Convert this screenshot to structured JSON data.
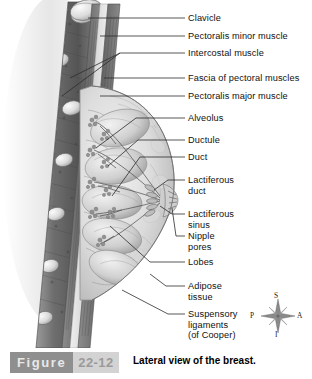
{
  "figure": {
    "label": "Figure",
    "number": "22-12",
    "caption": "Lateral view of the breast.",
    "bar_dark_color": "#8f8f8f",
    "bar_light_color": "#d3d3d3",
    "caption_color": "#000000"
  },
  "illustration": {
    "title": "lateral-view-of-breast",
    "description": "Sagittal cutaway of the chest wall and breast showing ribs, pectoral muscles, glandular lobes, ducts and nipple",
    "line_color": "#3a3a3a",
    "tissue_light": "#e6e6e6",
    "tissue_mid": "#c2c2c2",
    "tissue_dark": "#8a8a8a",
    "muscle_dark": "#5c5c5c"
  },
  "labels": [
    {
      "id": "clavicle",
      "text": "Clavicle"
    },
    {
      "id": "pectoralis-minor-muscle",
      "text": "Pectoralis minor muscle"
    },
    {
      "id": "intercostal-muscle",
      "text": "Intercostal muscle"
    },
    {
      "id": "fascia-of-pectoral-muscles",
      "text": "Fascia of pectoral muscles"
    },
    {
      "id": "pectoralis-major-muscle",
      "text": "Pectoralis major muscle"
    },
    {
      "id": "alveolus",
      "text": "Alveolus"
    },
    {
      "id": "ductule",
      "text": "Ductule"
    },
    {
      "id": "duct",
      "text": "Duct"
    },
    {
      "id": "lactiferous-duct",
      "text": "Lactiferous\nduct"
    },
    {
      "id": "lactiferous-sinus",
      "text": "Lactiferous\nsinus"
    },
    {
      "id": "nipple-pores",
      "text": "Nipple\npores"
    },
    {
      "id": "lobes",
      "text": "Lobes"
    },
    {
      "id": "adipose-tissue",
      "text": "Adipose\ntissue"
    },
    {
      "id": "suspensory-ligaments",
      "text": "Suspensory\nligaments\n(of Cooper)"
    }
  ],
  "compass": {
    "name": "anatomical-orientation-compass",
    "superior": "S",
    "posterior": "P",
    "anterior": "A",
    "inferior": "I"
  }
}
